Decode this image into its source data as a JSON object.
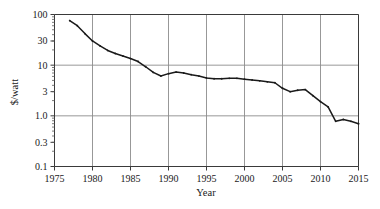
{
  "chart_data": {
    "type": "line",
    "title": "",
    "xlabel": "Year",
    "ylabel": "$/watt",
    "xlim": [
      1975,
      2015
    ],
    "ylim": [
      0.1,
      100
    ],
    "yscale": "log",
    "xscale": "linear",
    "grid": true,
    "legend": false,
    "xticks": [
      1975,
      1980,
      1985,
      1990,
      1995,
      2000,
      2005,
      2010,
      2015
    ],
    "xtick_labels": [
      "1975",
      "1980",
      "1985",
      "1990",
      "1995",
      "2000",
      "2005",
      "2010",
      "2015"
    ],
    "yticks": [
      0.1,
      0.3,
      1.0,
      3,
      10,
      30,
      100
    ],
    "ytick_labels": [
      "0.1",
      "0.3",
      "1.0",
      "3",
      "10",
      "30",
      "100"
    ],
    "series": [
      {
        "name": "Solar module price",
        "color": "#1a1a1a",
        "x": [
          1977,
          1978,
          1979,
          1980,
          1981,
          1982,
          1983,
          1984,
          1985,
          1986,
          1987,
          1988,
          1989,
          1990,
          1991,
          1992,
          1993,
          1994,
          1995,
          1996,
          1997,
          1998,
          1999,
          2000,
          2001,
          2002,
          2003,
          2004,
          2005,
          2006,
          2007,
          2008,
          2009,
          2010,
          2011,
          2012,
          2013,
          2014,
          2015
        ],
        "y": [
          76.0,
          60.0,
          42.0,
          30.0,
          24.0,
          19.5,
          17.0,
          15.2,
          13.5,
          11.8,
          9.3,
          7.2,
          6.1,
          6.8,
          7.3,
          7.0,
          6.5,
          6.1,
          5.6,
          5.4,
          5.4,
          5.5,
          5.5,
          5.3,
          5.1,
          4.9,
          4.7,
          4.5,
          3.5,
          3.0,
          3.2,
          3.3,
          2.5,
          1.9,
          1.5,
          0.78,
          0.85,
          0.78,
          0.7
        ]
      }
    ]
  },
  "axes": {
    "y_axis_title": "$/watt",
    "x_axis_title": "Year"
  }
}
